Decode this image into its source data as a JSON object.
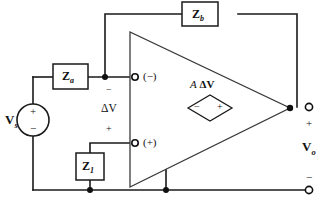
{
  "figure": {
    "background_color": "#ffffff",
    "wire_color": "#1a1a1a"
  },
  "components": {
    "source": {
      "name": "independent-voltage-source",
      "label": "V",
      "subscript": "s",
      "plus_sign": "+",
      "minus_sign": "−"
    },
    "impedance_a": {
      "name": "series-input-impedance",
      "label": "Z",
      "subscript": "a"
    },
    "impedance_b": {
      "name": "feedback-impedance",
      "label": "Z",
      "subscript": "b"
    },
    "impedance_1": {
      "name": "noninverting-leg-impedance",
      "label": "Z",
      "subscript": "1"
    },
    "dependent_source": {
      "name": "dependent-voltage-source",
      "gain_symbol": "A",
      "delta_v": "ΔV",
      "label": "A ΔV",
      "minus_sign": "−",
      "plus_sign": "+"
    },
    "amplifier": {
      "name": "op-amp-triangle"
    }
  },
  "labels": {
    "inverting_terminal": "(−)",
    "noninverting_terminal": "(+)",
    "differential_voltage": "ΔV",
    "differential_minus": "−",
    "differential_plus": "+",
    "output_label": "V",
    "output_subscript": "o",
    "output_plus": "+",
    "output_minus": "−"
  }
}
